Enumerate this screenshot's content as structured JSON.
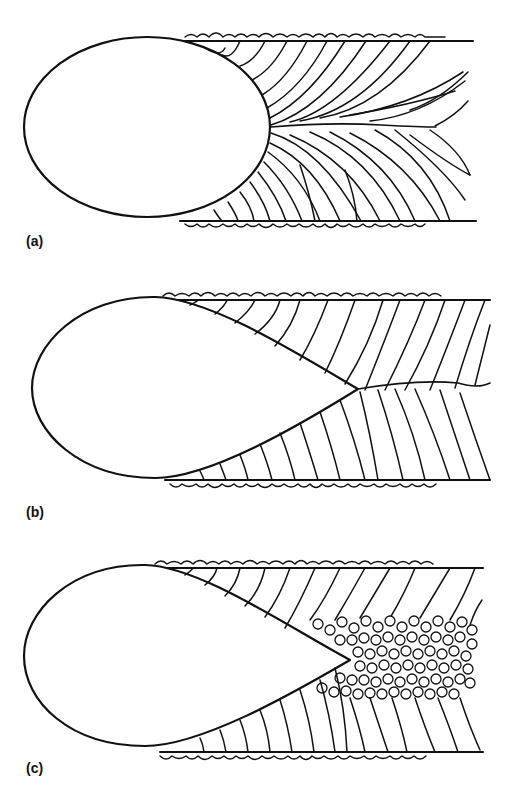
{
  "figure": {
    "panels": [
      {
        "id": "a",
        "label": "(a)",
        "pool_shape": "elliptical",
        "grain_growth": "columnar grains curving toward weld centerline"
      },
      {
        "id": "b",
        "label": "(b)",
        "pool_shape": "teardrop",
        "grain_growth": "straight columnar grains meeting at centerline"
      },
      {
        "id": "c",
        "label": "(c)",
        "pool_shape": "teardrop",
        "grain_growth": "columnar grains with equiaxed grains at centerline"
      }
    ],
    "colors": {
      "line": "#111111",
      "background": "#ffffff"
    }
  }
}
